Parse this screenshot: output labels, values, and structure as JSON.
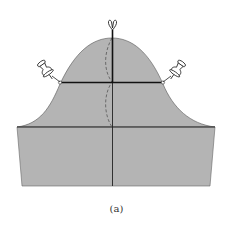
{
  "figure": {
    "caption": "(a)",
    "colors": {
      "fill": "#b4b4b4",
      "line": "#222222",
      "dashed": "#555555",
      "pin_fill": "#ffffff",
      "background": "#ffffff"
    },
    "elements": {
      "cap_peak": [
        112,
        38
      ],
      "cap_base_y": 127,
      "cap_left_x": 17,
      "cap_right_x": 215,
      "rect_bottom_y": 186,
      "rect_bottom_left_x": 22,
      "rect_bottom_right_x": 210,
      "center_x": 112,
      "bicep_y": 82,
      "bicep_left_x": 60,
      "bicep_right_x": 163
    },
    "pins": [
      {
        "name": "top-pin",
        "x": 112,
        "y": 22
      },
      {
        "name": "left-pin",
        "x": 45,
        "y": 70
      },
      {
        "name": "right-pin",
        "x": 178,
        "y": 70
      }
    ]
  }
}
